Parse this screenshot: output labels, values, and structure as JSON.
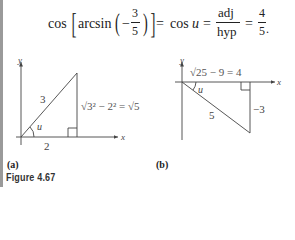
{
  "equation": {
    "lhs_func": "cos",
    "inner_func": "arcsin",
    "minus": "−",
    "frac1_num": "3",
    "frac1_den": "5",
    "eq1": "=",
    "mid": "cos",
    "mid_var": "u",
    "eq2": "=",
    "frac2_num": "adj",
    "frac2_den": "hyp",
    "eq3": "=",
    "frac3_num": "4",
    "frac3_den": "5",
    "end": "."
  },
  "figure_a": {
    "label": "(a)",
    "axis_x": "x",
    "axis_y": "y",
    "hyp_label": "3",
    "base_label": "2",
    "angle_label": "u",
    "side_label": "√3² − 2² = √5"
  },
  "figure_b": {
    "label": "(b)",
    "axis_x": "x",
    "axis_y": "y",
    "hyp_label": "5",
    "top_label": "√25 − 9 = 4",
    "side_label": "−3",
    "angle_label": "u"
  },
  "caption": "Figure 4.67"
}
